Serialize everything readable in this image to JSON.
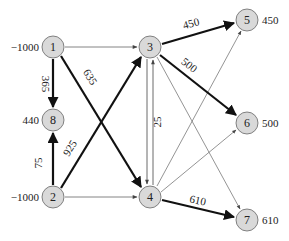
{
  "diagram": {
    "type": "network-flow",
    "nodes": [
      {
        "id": "1",
        "label": "1",
        "supply": "−1000",
        "x": 53,
        "y": 47,
        "supply_side": "left"
      },
      {
        "id": "2",
        "label": "2",
        "supply": "−1000",
        "x": 53,
        "y": 197,
        "supply_side": "left"
      },
      {
        "id": "3",
        "label": "3",
        "supply": "",
        "x": 150,
        "y": 47,
        "supply_side": "none"
      },
      {
        "id": "4",
        "label": "4",
        "supply": "",
        "x": 150,
        "y": 197,
        "supply_side": "none"
      },
      {
        "id": "5",
        "label": "5",
        "supply": "450",
        "x": 247,
        "y": 20,
        "supply_side": "right"
      },
      {
        "id": "6",
        "label": "6",
        "supply": "500",
        "x": 247,
        "y": 123,
        "supply_side": "right"
      },
      {
        "id": "7",
        "label": "7",
        "supply": "610",
        "x": 247,
        "y": 220,
        "supply_side": "right"
      },
      {
        "id": "8",
        "label": "8",
        "supply": "440",
        "x": 53,
        "y": 120,
        "supply_side": "left"
      }
    ],
    "edges": [
      {
        "from": "1",
        "to": "3",
        "flow": "",
        "bold": false
      },
      {
        "from": "1",
        "to": "8",
        "flow": "365",
        "bold": true
      },
      {
        "from": "1",
        "to": "4",
        "flow": "635",
        "bold": true
      },
      {
        "from": "2",
        "to": "8",
        "flow": "75",
        "bold": true
      },
      {
        "from": "2",
        "to": "3",
        "flow": "925",
        "bold": true
      },
      {
        "from": "2",
        "to": "4",
        "flow": "",
        "bold": false
      },
      {
        "from": "3",
        "to": "5",
        "flow": "450",
        "bold": true
      },
      {
        "from": "3",
        "to": "6",
        "flow": "500",
        "bold": true
      },
      {
        "from": "3",
        "to": "4",
        "flow": "",
        "bold": false
      },
      {
        "from": "4",
        "to": "3",
        "flow": "25",
        "bold": false
      },
      {
        "from": "3",
        "to": "7",
        "flow": "",
        "bold": false
      },
      {
        "from": "4",
        "to": "5",
        "flow": "",
        "bold": false
      },
      {
        "from": "4",
        "to": "6",
        "flow": "",
        "bold": false
      },
      {
        "from": "4",
        "to": "7",
        "flow": "610",
        "bold": true
      }
    ],
    "labels": {
      "e1_8": "365",
      "e1_4": "635",
      "e2_8": "75",
      "e2_3": "925",
      "e3_5": "450",
      "e3_6": "500",
      "e4_3": "25",
      "e4_7": "610"
    },
    "supplies": {
      "n1": "−1000",
      "n2": "−1000",
      "n5": "450",
      "n6": "500",
      "n7": "610",
      "n8": "440"
    },
    "colors": {
      "node_fill": "#d9d9d9",
      "node_stroke": "#555555",
      "edge_bold": "#111111",
      "edge_thin": "#555555"
    }
  }
}
